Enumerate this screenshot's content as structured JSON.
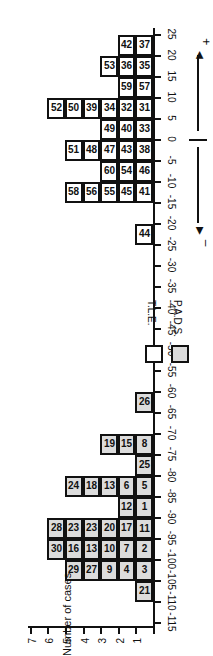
{
  "chart_data": {
    "type": "bar",
    "subtype": "stacked-case-histogram",
    "orientation_in_image": "rotated 90 degrees clockwise",
    "title": "",
    "xlabel": "",
    "ylabel": "Number of cases",
    "x_ticks": [
      -115,
      -110,
      -105,
      -100,
      -95,
      -90,
      -85,
      -80,
      -75,
      -70,
      -65,
      -60,
      -55,
      -50,
      -45,
      -40,
      -35,
      -30,
      -25,
      -20,
      -15,
      -10,
      -5,
      0,
      5,
      10,
      15,
      20,
      25
    ],
    "y_ticks": [
      1,
      2,
      3,
      4,
      5,
      6,
      7
    ],
    "xlim": [
      -115,
      25
    ],
    "ylim": [
      0,
      7
    ],
    "bin_width": 5,
    "direction_labels": {
      "negative": "–",
      "positive": "+"
    },
    "legend": [
      {
        "label": "P.A.D.S.",
        "fill": "#dcdcdc"
      },
      {
        "label": "T.L.E.",
        "fill": "#ffffff"
      }
    ],
    "bins": [
      {
        "range": [
          -110,
          -105
        ],
        "series": "P.A.D.S.",
        "cases": [
          21
        ]
      },
      {
        "range": [
          -105,
          -100
        ],
        "series": "P.A.D.S.",
        "cases": [
          3,
          4,
          9,
          27,
          29
        ]
      },
      {
        "range": [
          -100,
          -95
        ],
        "series": "P.A.D.S.",
        "cases": [
          2,
          7,
          10,
          13,
          16,
          30
        ]
      },
      {
        "range": [
          -95,
          -90
        ],
        "series": "P.A.D.S.",
        "cases": [
          11,
          17,
          20,
          23,
          23,
          28
        ]
      },
      {
        "range": [
          -90,
          -85
        ],
        "series": "P.A.D.S.",
        "cases": [
          1,
          12
        ]
      },
      {
        "range": [
          -85,
          -80
        ],
        "series": "P.A.D.S.",
        "cases": [
          5,
          6,
          13,
          18,
          24
        ]
      },
      {
        "range": [
          -80,
          -75
        ],
        "series": "P.A.D.S.",
        "cases": [
          25
        ]
      },
      {
        "range": [
          -75,
          -70
        ],
        "series": "P.A.D.S.",
        "cases": [
          8,
          15,
          19
        ]
      },
      {
        "range": [
          -65,
          -60
        ],
        "series": "P.A.D.S.",
        "cases": [
          26
        ]
      },
      {
        "range": [
          -25,
          -20
        ],
        "series": "T.L.E.",
        "cases": [
          44
        ]
      },
      {
        "range": [
          -15,
          -10
        ],
        "series": "T.L.E.",
        "cases": [
          41,
          45,
          55,
          56,
          58
        ]
      },
      {
        "range": [
          -10,
          -5
        ],
        "series": "T.L.E.",
        "cases": [
          46,
          54,
          60
        ]
      },
      {
        "range": [
          -5,
          0
        ],
        "series": "T.L.E.",
        "cases": [
          38,
          43,
          47,
          48,
          51
        ]
      },
      {
        "range": [
          0,
          5
        ],
        "series": "T.L.E.",
        "cases": [
          33,
          40,
          49
        ]
      },
      {
        "range": [
          5,
          10
        ],
        "series": "T.L.E.",
        "cases": [
          31,
          32,
          34,
          39,
          50,
          52
        ]
      },
      {
        "range": [
          10,
          15
        ],
        "series": "T.L.E.",
        "cases": [
          57,
          59
        ]
      },
      {
        "range": [
          15,
          20
        ],
        "series": "T.L.E.",
        "cases": [
          35,
          36,
          53
        ]
      },
      {
        "range": [
          20,
          25
        ],
        "series": "T.L.E.",
        "cases": [
          37,
          42
        ]
      }
    ],
    "categories": [
      "-110",
      "-105",
      "-100",
      "-95",
      "-90",
      "-85",
      "-80",
      "-75",
      "-70",
      "-65",
      "-60",
      "-55",
      "-50",
      "-45",
      "-40",
      "-35",
      "-30",
      "-25",
      "-20",
      "-15",
      "-10",
      "-5",
      "0",
      "5",
      "10",
      "15",
      "20"
    ],
    "series": [
      {
        "name": "P.A.D.S.",
        "values": [
          1,
          5,
          6,
          6,
          2,
          5,
          1,
          3,
          0,
          1,
          0,
          0,
          0,
          0,
          0,
          0,
          0,
          0,
          0,
          0,
          0,
          0,
          0,
          0,
          0,
          0,
          0
        ]
      },
      {
        "name": "T.L.E.",
        "values": [
          0,
          0,
          0,
          0,
          0,
          0,
          0,
          0,
          0,
          0,
          0,
          0,
          0,
          0,
          0,
          0,
          0,
          1,
          0,
          5,
          3,
          5,
          3,
          6,
          2,
          3,
          2
        ]
      }
    ]
  }
}
